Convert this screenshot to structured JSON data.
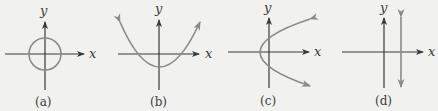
{
  "panels": [
    {
      "id": "a",
      "caption": "(a)",
      "x_label": "x",
      "y_label": "y",
      "curve": "circle centered at origin"
    },
    {
      "id": "b",
      "caption": "(b)",
      "x_label": "x",
      "y_label": "y",
      "curve": "upward-opening parabola with vertex below origin"
    },
    {
      "id": "c",
      "caption": "(c)",
      "x_label": "x",
      "y_label": "y",
      "curve": "rightward-opening parabola with vertex left of origin"
    },
    {
      "id": "d",
      "caption": "(d)",
      "x_label": "x",
      "y_label": "y",
      "curve": "vertical line right of y-axis"
    }
  ],
  "colors": {
    "background": "#f1f1ef",
    "axis": "#3a3a3a",
    "curve": "#8a8a8a"
  }
}
